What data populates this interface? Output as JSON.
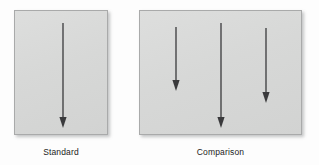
{
  "figure": {
    "type": "perception-stimulus-diagram",
    "background_color": "#fdfdfd",
    "panel_fill_color": "#d7d8d7",
    "panel_border_color": "#a9aaaa",
    "arrow_color": "#3a3a3c"
  },
  "panels": [
    {
      "id": "standard",
      "label": "Standard",
      "x": 14,
      "y": 10,
      "width": 94,
      "height": 125,
      "arrows": [
        {
          "name": "standard-arrow",
          "x": 48,
          "y_start": 12,
          "y_end": 116,
          "length": 104,
          "direction": "down"
        }
      ]
    },
    {
      "id": "comparison",
      "label": "Comparison",
      "x": 139,
      "y": 10,
      "width": 163,
      "height": 125,
      "arrows": [
        {
          "name": "comparison-arrow-1",
          "x": 36,
          "y_start": 16,
          "y_end": 79,
          "length": 63,
          "direction": "down"
        },
        {
          "name": "comparison-arrow-2",
          "x": 81,
          "y_start": 12,
          "y_end": 116,
          "length": 104,
          "direction": "down"
        },
        {
          "name": "comparison-arrow-3",
          "x": 126,
          "y_start": 17,
          "y_end": 91,
          "length": 74,
          "direction": "down"
        }
      ]
    }
  ],
  "bleed_text": {
    "left_line_1": "се-тлес",
    "left_line_2": "натли и",
    "left_line_3": "нтаига н",
    "right_line_1": "ехт ент",
    "right_line_2": "атлии у",
    "right_line_3": "но носиап"
  },
  "captions": {
    "standard": "Standard",
    "comparison": "Comparison"
  }
}
